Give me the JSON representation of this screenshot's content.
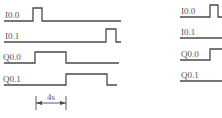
{
  "diagram": {
    "type": "plc-timing-diagram",
    "left_panel": {
      "signals": [
        {
          "label": "I0.0",
          "label_pos": [
            5,
            18
          ],
          "path": "M4,21 H33 V8 H42 V21 H121"
        },
        {
          "label": "I0.1",
          "label_pos": [
            5,
            39
          ],
          "path": "M4,42 H106 V29 H116 V42 H121"
        },
        {
          "label": "Q0.0",
          "label_pos": [
            3,
            60
          ],
          "path": "M4,63 H35 V52 H66 V63 H119"
        },
        {
          "label": "Q0.1",
          "label_pos": [
            3,
            82
          ],
          "path": "M4,85 H66 V74 H107 V85 H117"
        }
      ],
      "dimension": {
        "label": "4s",
        "x1": 36,
        "x2": 66,
        "y": 103,
        "label_pos": [
          51,
          100
        ]
      }
    },
    "right_panel": {
      "signals": [
        {
          "label": "I0.0",
          "label_pos": [
            181,
            14
          ],
          "path": "M180,17 H210 V5 H218 V17 H222"
        },
        {
          "label": "I0.1",
          "label_pos": [
            181,
            35
          ],
          "path": "M180,38 H222"
        },
        {
          "label": "Q0.0",
          "label_pos": [
            181,
            57
          ],
          "path": "M180,60 H210 V49 H222"
        },
        {
          "label": "Q0.1",
          "label_pos": [
            181,
            78
          ],
          "path": "M180,81 H222"
        }
      ]
    }
  }
}
